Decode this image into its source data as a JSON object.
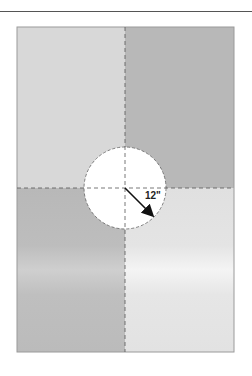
{
  "diagram": {
    "title": "",
    "quadrants": [
      {
        "position": "top-left",
        "color": "#d6d6d6"
      },
      {
        "position": "top-right",
        "color": "#b9b9b9"
      },
      {
        "position": "bottom-left",
        "color": "#bcbcbc"
      },
      {
        "position": "bottom-right",
        "color": "#e6e6e6"
      }
    ],
    "center_circle": {
      "fill": "#ffffff",
      "radius_label": "12\""
    },
    "colors": {
      "line": "#555555",
      "border": "#9a9a9a"
    }
  }
}
